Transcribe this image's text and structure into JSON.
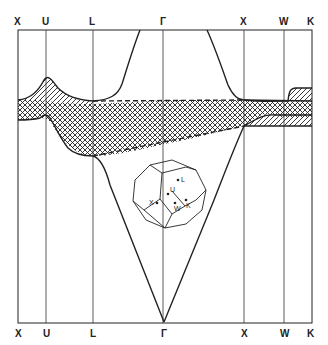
{
  "diagram": {
    "type": "band-structure",
    "top_labels": [
      "X",
      "U",
      "L",
      "Γ",
      "X",
      "W",
      "K"
    ],
    "bottom_labels": [
      "X",
      "U",
      "L",
      "Γ",
      "X",
      "W",
      "K"
    ],
    "brillouin_zone_labels": [
      "L",
      "U",
      "X",
      "W",
      "K"
    ],
    "legend": {
      "crosshatch": "d-band region",
      "diagonal_hatch": "hybridization gap region"
    },
    "colors": {
      "line": "#222222",
      "background": "#ffffff"
    }
  }
}
